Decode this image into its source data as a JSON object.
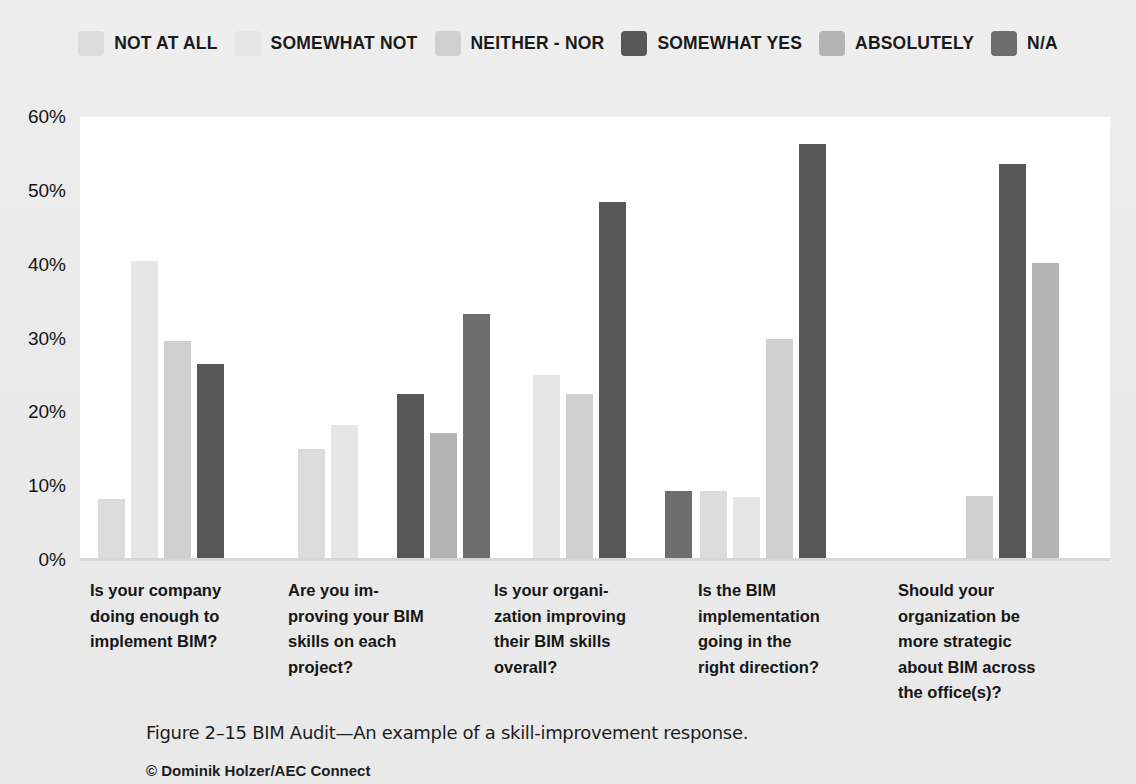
{
  "legend": {
    "items": [
      {
        "label": "NOT AT ALL",
        "color": "#dcdcdc",
        "icon": "legend-swatch-icon"
      },
      {
        "label": "SOMEWHAT NOT",
        "color": "#e6e6e6",
        "icon": "legend-swatch-icon"
      },
      {
        "label": "NEITHER - NOR",
        "color": "#cfcfcf",
        "icon": "legend-swatch-icon"
      },
      {
        "label": "SOMEWHAT YES",
        "color": "#575757",
        "icon": "legend-swatch-icon"
      },
      {
        "label": "ABSOLUTELY",
        "color": "#b4b4b4",
        "icon": "legend-swatch-icon"
      },
      {
        "label": "N/A",
        "color": "#6e6e6e",
        "icon": "legend-swatch-icon"
      }
    ]
  },
  "caption": {
    "text": "Figure 2–15  BIM Audit—An example of a skill-improvement response.",
    "credit": "© Dominik Holzer/AEC Connect"
  },
  "chart_data": {
    "type": "bar",
    "title": "BIM Audit—An example of a skill-improvement response.",
    "xlabel": "",
    "ylabel": "",
    "ylim": [
      0,
      60
    ],
    "yticks": [
      60,
      50,
      40,
      30,
      20,
      10,
      0
    ],
    "ytick_labels": [
      "60%",
      "50%",
      "40%",
      "30%",
      "20%",
      "10%",
      "0%"
    ],
    "grid": false,
    "legend_position": "top",
    "categories": [
      "Is your company doing enough to implement BIM?",
      "Are you im- proving your BIM skills on each project?",
      "Is your organi- zation improving their BIM skills overall?",
      "Is the BIM implementation going in the right direction?",
      "Should your organization be more strategic about BIM across the office(s)?"
    ],
    "category_lines": [
      [
        "Is your company",
        "doing enough to",
        "implement BIM?"
      ],
      [
        "Are you im-",
        "proving your BIM",
        "skills on each",
        "project?"
      ],
      [
        "Is your organi-",
        "zation improving",
        "their BIM skills",
        "overall?"
      ],
      [
        "Is the BIM",
        "implementation",
        "going in the",
        "right direction?"
      ],
      [
        "Should your",
        "organization be",
        "more strategic",
        "about BIM across",
        "the office(s)?"
      ]
    ],
    "series": [
      {
        "name": "NOT AT ALL",
        "color": "#dcdcdc",
        "values": [
          8.3,
          15.0,
          null,
          9.4,
          null
        ]
      },
      {
        "name": "SOMEWHAT NOT",
        "color": "#e6e6e6",
        "values": [
          40.5,
          18.3,
          25.0,
          8.6,
          null
        ]
      },
      {
        "name": "NEITHER - NOR",
        "color": "#cfcfcf",
        "values": [
          29.7,
          null,
          22.5,
          30.0,
          8.7
        ]
      },
      {
        "name": "SOMEWHAT YES",
        "color": "#575757",
        "values": [
          26.5,
          22.5,
          48.5,
          56.4,
          53.7
        ]
      },
      {
        "name": "ABSOLUTELY",
        "color": "#b4b4b4",
        "values": [
          null,
          17.2,
          null,
          null,
          40.2
        ]
      },
      {
        "name": "N/A",
        "color": "#6e6e6e",
        "values": [
          null,
          33.3,
          9.4,
          null,
          null
        ]
      }
    ]
  }
}
